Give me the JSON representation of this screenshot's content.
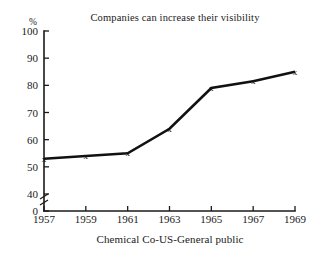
{
  "chart_data": {
    "type": "line",
    "title": "Companies can increase their visibility",
    "xlabel": "Chemical Co-US-General public",
    "ylabel": "%",
    "x": [
      1957,
      1959,
      1961,
      1963,
      1965,
      1967,
      1969
    ],
    "xtick_labels": [
      "1957",
      "1959",
      "1961",
      "1963",
      "1965",
      "1967",
      "1969"
    ],
    "values": [
      53,
      54,
      55,
      64,
      79,
      81.5,
      85
    ],
    "ytick_labels": [
      "100",
      "90",
      "80",
      "70",
      "60",
      "50",
      "40",
      "0"
    ],
    "ytick_values": [
      100,
      90,
      80,
      70,
      60,
      50,
      40,
      0
    ],
    "ylim": [
      40,
      100
    ],
    "xlim": [
      1957,
      1969
    ],
    "axis_break": true,
    "axis_break_between": [
      0,
      40
    ],
    "marker": "x",
    "grid": false,
    "legend": null,
    "line_color": "#111111",
    "axis_color": "#1a1a1a",
    "background": "#ffffff"
  },
  "figure": {
    "percent_symbol": "%",
    "marker_glyph": "x"
  }
}
